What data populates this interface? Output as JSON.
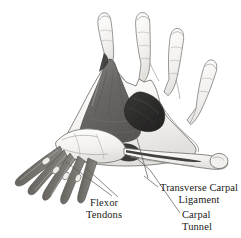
{
  "figure": {
    "background_color": "#ffffff",
    "medium": "pencil anatomical illustration",
    "width": 241,
    "height": 238
  },
  "labels": {
    "flexor_tendons": {
      "line1": "Flexor",
      "line2": "Tendons"
    },
    "transverse_carpal_ligament": {
      "line1": "Transverse Carpal",
      "line2": "Ligament"
    },
    "carpal_tunnel": {
      "line1": "Carpal",
      "line2": "Tunnel"
    }
  },
  "colors": {
    "text": "#1a1a1a",
    "leader_line": "#4a4a4a",
    "outline": "#5a5a5a",
    "skin_light": "#f4f2f0",
    "shade_mid": "#8e8c8a",
    "shade_palm": "#6f6d6b",
    "shade_dark": "#2d2c2b",
    "tendon": "#7a7876"
  },
  "parts": [
    {
      "name": "index-finger"
    },
    {
      "name": "middle-finger"
    },
    {
      "name": "ring-finger"
    },
    {
      "name": "little-finger"
    },
    {
      "name": "thumb"
    },
    {
      "name": "palmar-aponeurosis"
    },
    {
      "name": "transverse-carpal-ligament"
    },
    {
      "name": "carpal-tunnel-opening"
    },
    {
      "name": "flexor-tendon-bundle"
    },
    {
      "name": "wrist"
    }
  ]
}
